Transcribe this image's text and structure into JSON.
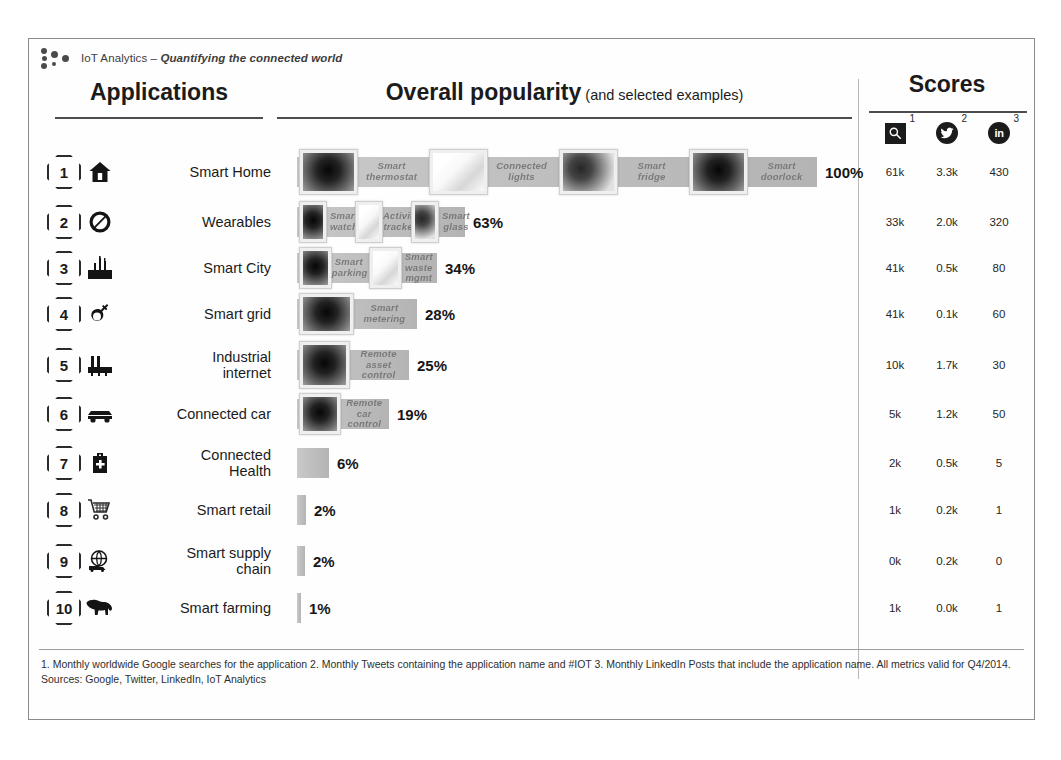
{
  "brand": {
    "name": "IoT Analytics",
    "separator": " – ",
    "tagline": "Quantifying the connected world",
    "logo_icon": "iot-analytics-dots-logo"
  },
  "headers": {
    "applications": "Applications",
    "popularity_main": "Overall popularity",
    "popularity_sub": " (and selected examples)",
    "scores": "Scores"
  },
  "score_columns": [
    {
      "icon": "google-search-icon",
      "superscript": "1",
      "name": "Google searches"
    },
    {
      "icon": "twitter-bird-icon",
      "superscript": "2",
      "name": "Twitter tweets"
    },
    {
      "icon": "linkedin-icon",
      "superscript": "3",
      "name": "LinkedIn posts"
    }
  ],
  "chart_data": {
    "type": "bar",
    "title": "Overall popularity (and selected examples)",
    "xlabel": "",
    "ylabel": "",
    "xlim": [
      0,
      100
    ],
    "unit": "%",
    "grid": false,
    "legend": "none",
    "categories": [
      "Smart Home",
      "Wearables",
      "Smart City",
      "Smart grid",
      "Industrial internet",
      "Connected car",
      "Connected Health",
      "Smart retail",
      "Smart supply chain",
      "Smart farming"
    ],
    "values": [
      100,
      63,
      34,
      28,
      25,
      19,
      6,
      2,
      2,
      1
    ],
    "value_labels": [
      "100%",
      "63%",
      "34%",
      "28%",
      "25%",
      "19%",
      "6%",
      "2%",
      "2%",
      "1%"
    ],
    "series": [
      {
        "name": "Google searches (monthly)",
        "values": [
          "61k",
          "33k",
          "41k",
          "41k",
          "10k",
          "5k",
          "2k",
          "1k",
          "0k",
          "1k"
        ]
      },
      {
        "name": "Tweets (monthly)",
        "values": [
          "3.3k",
          "2.0k",
          "0.5k",
          "0.1k",
          "1.7k",
          "1.2k",
          "0.5k",
          "0.2k",
          "0.2k",
          "0.0k"
        ]
      },
      {
        "name": "LinkedIn posts (monthly)",
        "values": [
          "430",
          "320",
          "80",
          "60",
          "30",
          "50",
          "5",
          "1",
          "0",
          "1"
        ]
      }
    ]
  },
  "rows": [
    {
      "rank": "1",
      "icon": "house-icon",
      "label": "Smart Home",
      "pct": "100%",
      "bar_width": 520,
      "examples": [
        "Smart\nthermostat",
        "Connected\nlights",
        "Smart\nfridge",
        "Smart\ndoorlock"
      ],
      "scores": [
        "61k",
        "3.3k",
        "430"
      ]
    },
    {
      "rank": "2",
      "icon": "wearable-ring-icon",
      "label": "Wearables",
      "pct": "63%",
      "bar_width": 168,
      "examples": [
        "Smart\nwatch",
        "Activity\ntracker",
        "Smart\nglass"
      ],
      "scores": [
        "33k",
        "2.0k",
        "320"
      ]
    },
    {
      "rank": "3",
      "icon": "city-buildings-icon",
      "label": "Smart City",
      "pct": "34%",
      "bar_width": 140,
      "examples": [
        "Smart\nparking",
        "Smart\nwaste\nmgmt"
      ],
      "scores": [
        "41k",
        "0.5k",
        "80"
      ]
    },
    {
      "rank": "4",
      "icon": "power-plug-icon",
      "label": "Smart grid",
      "pct": "28%",
      "bar_width": 120,
      "examples": [
        "Smart\nmetering"
      ],
      "scores": [
        "41k",
        "0.1k",
        "60"
      ]
    },
    {
      "rank": "5",
      "icon": "factory-icon",
      "label": "Industrial\ninternet",
      "pct": "25%",
      "bar_width": 112,
      "examples": [
        "Remote\nasset control"
      ],
      "scores": [
        "10k",
        "1.7k",
        "30"
      ]
    },
    {
      "rank": "6",
      "icon": "car-icon",
      "label": "Connected car",
      "pct": "19%",
      "bar_width": 92,
      "examples": [
        "Remote\ncar\ncontrol"
      ],
      "scores": [
        "5k",
        "1.2k",
        "50"
      ]
    },
    {
      "rank": "7",
      "icon": "medical-kit-icon",
      "label": "Connected\nHealth",
      "pct": "6%",
      "bar_width": 32,
      "examples": [],
      "scores": [
        "2k",
        "0.5k",
        "5"
      ]
    },
    {
      "rank": "8",
      "icon": "shopping-cart-icon",
      "label": "Smart retail",
      "pct": "2%",
      "bar_width": 9,
      "examples": [],
      "scores": [
        "1k",
        "0.2k",
        "1"
      ]
    },
    {
      "rank": "9",
      "icon": "globe-truck-icon",
      "label": "Smart supply\nchain",
      "pct": "2%",
      "bar_width": 8,
      "examples": [],
      "scores": [
        "0k",
        "0.2k",
        "0"
      ]
    },
    {
      "rank": "10",
      "icon": "cow-icon",
      "label": "Smart farming",
      "pct": "1%",
      "bar_width": 4,
      "examples": [],
      "scores": [
        "1k",
        "0.0k",
        "1"
      ]
    }
  ],
  "footnote": {
    "notes": "1. Monthly worldwide Google searches for the application  2. Monthly Tweets containing the application name and #IOT  3. Monthly LinkedIn Posts that include the application name.  All metrics valid for Q4/2014.",
    "sources": "Sources: Google, Twitter, LinkedIn, IoT Analytics"
  }
}
